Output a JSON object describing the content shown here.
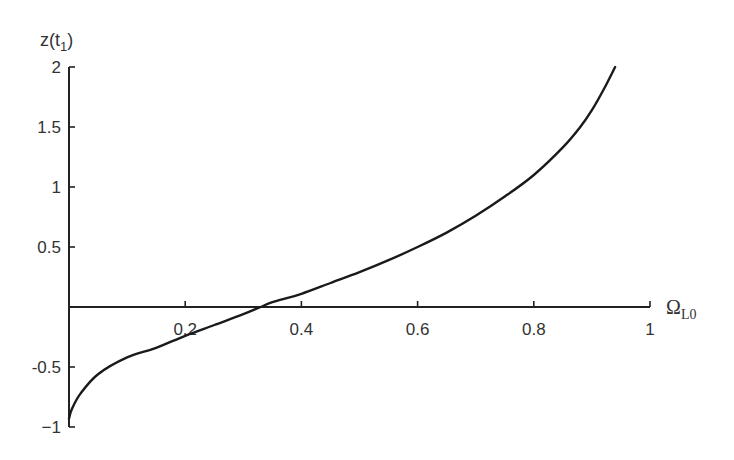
{
  "chart_data": {
    "type": "line",
    "title": "",
    "xlabel": "Ω",
    "xlabel_sub": "L0",
    "ylabel": "z(t",
    "ylabel_sub": "1",
    "ylabel_close": ")",
    "xlim": [
      0,
      1
    ],
    "ylim": [
      -1,
      2
    ],
    "grid": false,
    "legend": null,
    "x_ticks": [
      0.2,
      0.4,
      0.6,
      0.8,
      1
    ],
    "x_tick_labels": [
      "0.2",
      "0.4",
      "0.6",
      "0.8",
      "1"
    ],
    "y_ticks": [
      2,
      1.5,
      1,
      0.5,
      -0.5,
      -1
    ],
    "y_tick_labels": [
      "2",
      "1.5",
      "1",
      "0.5",
      "-0.5",
      "−1"
    ],
    "series": [
      {
        "name": "z(t1)",
        "x": [
          0.0,
          0.005,
          0.02,
          0.05,
          0.1,
          0.15,
          0.2,
          0.25,
          0.3,
          0.33,
          0.35,
          0.4,
          0.45,
          0.5,
          0.55,
          0.6,
          0.65,
          0.7,
          0.75,
          0.8,
          0.85,
          0.88,
          0.9,
          0.92,
          0.94
        ],
        "y": [
          -0.93,
          -0.85,
          -0.72,
          -0.56,
          -0.42,
          -0.34,
          -0.24,
          -0.15,
          -0.06,
          0.0,
          0.04,
          0.11,
          0.2,
          0.29,
          0.39,
          0.5,
          0.62,
          0.76,
          0.92,
          1.1,
          1.33,
          1.5,
          1.64,
          1.81,
          2.0
        ]
      }
    ]
  }
}
